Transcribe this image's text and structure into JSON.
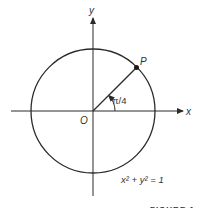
{
  "diagram": {
    "axis_x_label": "x",
    "axis_y_label": "y",
    "origin_label": "O",
    "point_label": "P",
    "angle_label": "π/4",
    "equation": "x² + y² = 1",
    "caption": "FIGURE 1"
  },
  "colors": {
    "stroke": "#2a2a2a",
    "text": "#333333"
  }
}
